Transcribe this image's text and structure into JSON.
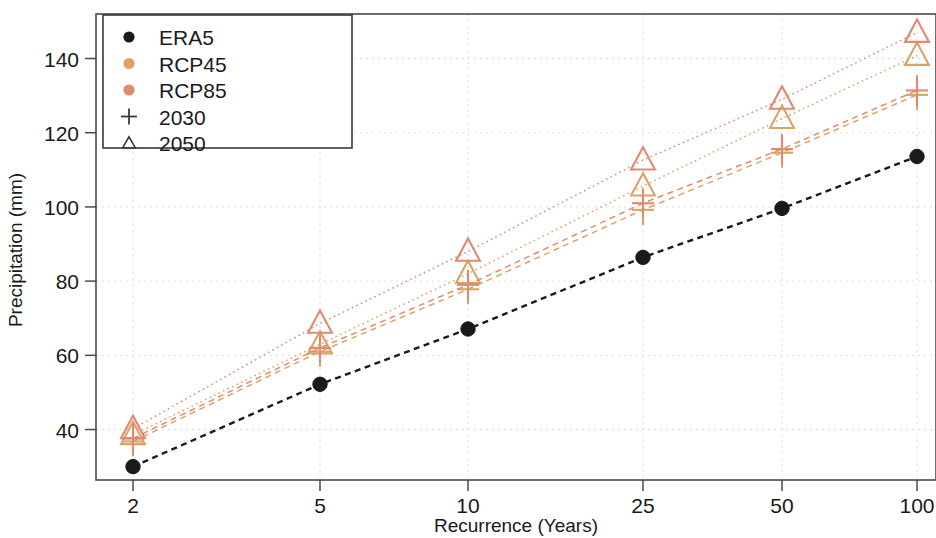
{
  "chart": {
    "type": "line",
    "xlabel": "Recurrence (Years)",
    "ylabel": "Precipitation (mm)",
    "x_ticks": [
      "2",
      "5",
      "10",
      "25",
      "50",
      "100"
    ],
    "y_ticks": [
      "40",
      "60",
      "80",
      "100",
      "120",
      "140"
    ]
  },
  "legend": {
    "items": [
      {
        "label": "ERA5",
        "marker": "dot",
        "color": "#1a1a1a"
      },
      {
        "label": "RCP45",
        "marker": "dot",
        "color": "#d9a464"
      },
      {
        "label": "RCP85",
        "marker": "dot",
        "color": "#e08a70"
      },
      {
        "label": "2030",
        "marker": "plus",
        "color": "#3a3a3a"
      },
      {
        "label": "2050",
        "marker": "triangle",
        "color": "#3a3a3a"
      }
    ]
  },
  "chart_data": {
    "type": "line",
    "title": "",
    "xlabel": "Recurrence (Years)",
    "ylabel": "Precipitation (mm)",
    "x": [
      2,
      5,
      10,
      25,
      50,
      100
    ],
    "x_tick_labels": [
      "2",
      "5",
      "10",
      "25",
      "50",
      "100"
    ],
    "y_tick_labels": [
      "40",
      "60",
      "80",
      "100",
      "120",
      "140"
    ],
    "xscale": "log",
    "ylim": [
      26,
      152
    ],
    "grid": true,
    "legend_position": "upper-left",
    "series": [
      {
        "name": "ERA5",
        "scenario": "ERA5",
        "horizon": "",
        "marker": "dot",
        "color": "#1a1a1a",
        "linestyle": "dashed",
        "values": [
          30.0,
          52.2,
          67.1,
          86.4,
          99.6,
          113.6
        ]
      },
      {
        "name": "RCP45 2030",
        "scenario": "RCP45",
        "horizon": "2030",
        "marker": "plus",
        "color": "#d9a464",
        "linestyle": "dashed",
        "values": [
          36.8,
          61.0,
          77.8,
          99.2,
          114.6,
          130.2
        ]
      },
      {
        "name": "RCP45 2050",
        "scenario": "RCP45",
        "horizon": "2050",
        "marker": "triangle",
        "color": "#d9a464",
        "linestyle": "dotted",
        "values": [
          38.6,
          63.0,
          82.0,
          105.6,
          123.8,
          140.8
        ]
      },
      {
        "name": "RCP85 2030",
        "scenario": "RCP85",
        "horizon": "2030",
        "marker": "plus",
        "color": "#e08a70",
        "linestyle": "dashed",
        "values": [
          37.6,
          62.0,
          79.0,
          101.0,
          115.6,
          131.4
        ]
      },
      {
        "name": "RCP85 2050",
        "scenario": "RCP85",
        "horizon": "2050",
        "marker": "triangle",
        "color": "#e08a70",
        "linestyle": "dotted",
        "values": [
          40.2,
          68.6,
          88.0,
          112.6,
          129.0,
          147.0
        ]
      }
    ]
  },
  "geometry": {
    "plot_left": 96,
    "plot_right": 936,
    "plot_top": 14,
    "plot_bottom": 480,
    "x_pixels": [
      133,
      320,
      468,
      643,
      782,
      917
    ],
    "y_value_top": 152,
    "y_value_bottom": 26.4,
    "legend_box": {
      "x": 103,
      "y": 15,
      "w": 249,
      "h": 133
    }
  }
}
